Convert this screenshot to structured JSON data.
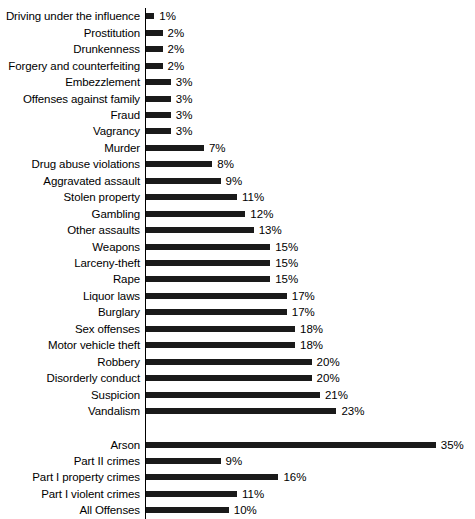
{
  "chart_data": {
    "type": "bar",
    "orientation": "horizontal",
    "title": "",
    "xlabel": "",
    "ylabel": "",
    "xlim": [
      0,
      35
    ],
    "grid": false,
    "legend": null,
    "value_suffix": "%",
    "categories": [
      "Driving under the influence",
      "Prostitution",
      "Drunkenness",
      "Forgery and counterfeiting",
      "Embezzlement",
      "Offenses against family",
      "Fraud",
      "Vagrancy",
      "Murder",
      "Drug abuse violations",
      "Aggravated assault",
      "Stolen property",
      "Gambling",
      "Other assaults",
      "Weapons",
      "Larceny-theft",
      "Rape",
      "Liquor laws",
      "Burglary",
      "Sex offenses",
      "Motor vehicle theft",
      "Robbery",
      "Disorderly conduct",
      "Suspicion",
      "Vandalism",
      "Arson",
      "Part II crimes",
      "Part I property crimes",
      "Part I violent crimes",
      "All Offenses"
    ],
    "values": [
      1,
      2,
      2,
      2,
      3,
      3,
      3,
      3,
      7,
      8,
      9,
      11,
      12,
      13,
      15,
      15,
      15,
      17,
      17,
      18,
      18,
      20,
      20,
      21,
      23,
      35,
      9,
      16,
      11,
      10
    ],
    "value_labels": [
      "1%",
      "2%",
      "2%",
      "2%",
      "3%",
      "3%",
      "3%",
      "3%",
      "7%",
      "8%",
      "9%",
      "11%",
      "12%",
      "13%",
      "15%",
      "15%",
      "15%",
      "17%",
      "17%",
      "18%",
      "18%",
      "20%",
      "20%",
      "21%",
      "23%",
      "35%",
      "9%",
      "16%",
      "11%",
      "10%"
    ],
    "group_break_after_index": 25,
    "bar_color": "#1a1a1a",
    "background_color": "#ffffff"
  }
}
